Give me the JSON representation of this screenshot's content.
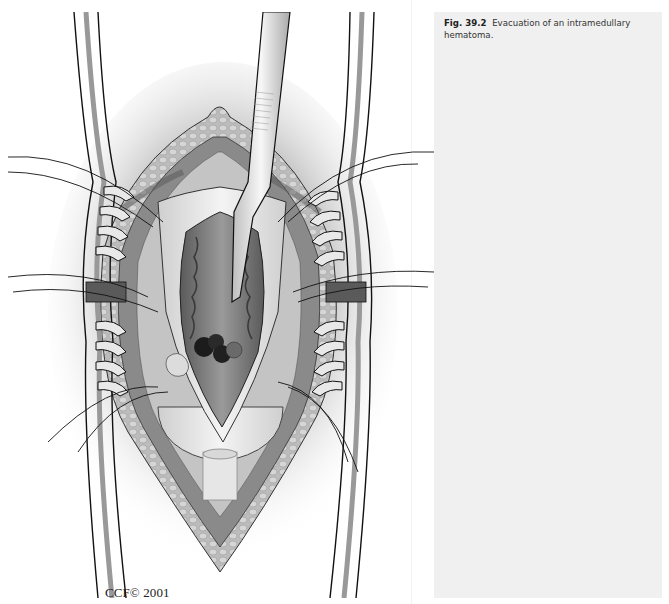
{
  "figure": {
    "label": "Fig. 39.2",
    "caption": "Evacuation of an intramedullary hematoma.",
    "credit": "CCF© 2001",
    "illustration": "surgical-illustration-spinal-cord-hematoma-evacuation"
  },
  "colors": {
    "page_background": "#ffffff",
    "caption_panel": "#f0f0f0",
    "caption_text": "#333333",
    "line_art": "#1a1a1a"
  }
}
